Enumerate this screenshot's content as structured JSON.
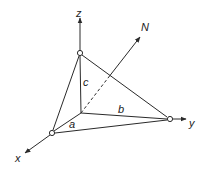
{
  "diagram": {
    "type": "3d-coordinate-tetrahedron",
    "colors": {
      "stroke": "#2a2a2a",
      "background": "#ffffff",
      "vertex_fill": "#ffffff"
    },
    "axes": {
      "x": {
        "label": "x"
      },
      "y": {
        "label": "y"
      },
      "z": {
        "label": "z"
      },
      "normal": {
        "label": "N"
      }
    },
    "intercepts": {
      "a": {
        "label": "a"
      },
      "b": {
        "label": "b"
      },
      "c": {
        "label": "c"
      }
    }
  }
}
